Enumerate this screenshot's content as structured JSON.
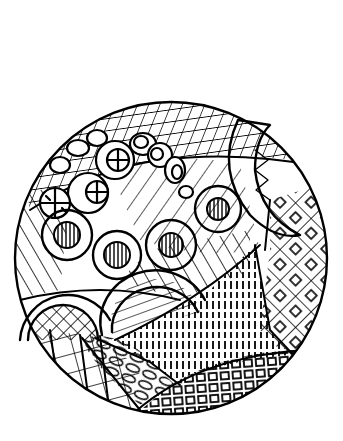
{
  "image": {
    "description": "Black ink zentangle doodle inside a circle",
    "width": 343,
    "height": 441,
    "background": "#ffffff",
    "ink": "#000000"
  },
  "circle": {
    "cx": 171,
    "cy": 258,
    "r": 156
  },
  "regions": [
    {
      "name": "top-grid-band",
      "pattern": "tilted-grid"
    },
    {
      "name": "ring-chain-left",
      "pattern": "rings-with-cross"
    },
    {
      "name": "diagonal-stripe-field",
      "pattern": "diagonal-lines"
    },
    {
      "name": "donut-row",
      "pattern": "rings-with-vertical-hatch"
    },
    {
      "name": "crescent-right",
      "pattern": "crescent-with-zigzag"
    },
    {
      "name": "diamond-lattice-right",
      "pattern": "diamond-grid-with-squares"
    },
    {
      "name": "vertical-dash-wedge",
      "pattern": "vertical-dashes"
    },
    {
      "name": "arch-crosshatch-left",
      "pattern": "crosshatch-arch"
    },
    {
      "name": "arch-fan-center",
      "pattern": "fan-lines-arch"
    },
    {
      "name": "brick-grid-bottom-left",
      "pattern": "square-grid"
    },
    {
      "name": "pebble-band",
      "pattern": "ovals"
    },
    {
      "name": "maze-squares-bottom",
      "pattern": "nested-squares"
    }
  ]
}
